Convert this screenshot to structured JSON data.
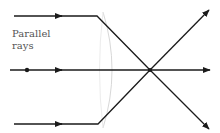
{
  "diagram": {
    "label_line1": "Parallel",
    "label_line2": "rays",
    "colors": {
      "ray": "#1a1a1a",
      "lens": "#d8d8d8",
      "label": "#555555"
    },
    "focal_point": {
      "x": 150,
      "y": 70
    },
    "rays": [
      {
        "name": "top-ray",
        "start": [
          14,
          16
        ],
        "bend": [
          97,
          16
        ],
        "end": [
          209,
          10
        ]
      },
      {
        "name": "axis-ray",
        "start": [
          10,
          70
        ],
        "end": [
          210,
          70
        ]
      },
      {
        "name": "bottom-ray",
        "start": [
          14,
          124
        ],
        "bend": [
          98,
          124
        ],
        "end": [
          209,
          129
        ]
      }
    ]
  }
}
